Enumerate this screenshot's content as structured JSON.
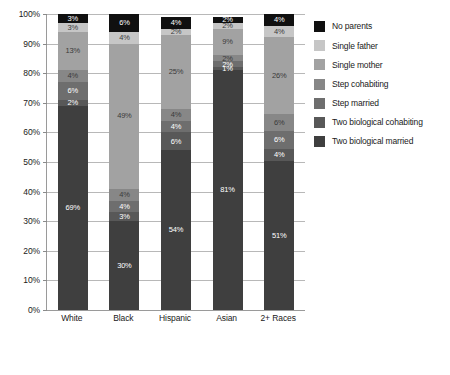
{
  "chart_data": {
    "type": "bar",
    "subtype": "stacked-100-percent",
    "title": "",
    "xlabel": "",
    "ylabel": "",
    "ylim": [
      0,
      100
    ],
    "ytick_labels": [
      "0%",
      "10%",
      "20%",
      "30%",
      "40%",
      "50%",
      "60%",
      "70%",
      "80%",
      "90%",
      "100%"
    ],
    "ytick_values": [
      0,
      10,
      20,
      30,
      40,
      50,
      60,
      70,
      80,
      90,
      100
    ],
    "grid": true,
    "legend_position": "right",
    "categories": [
      "White",
      "Black",
      "Hispanic",
      "Asian",
      "2+ Races"
    ],
    "series": [
      {
        "name": "Two biological married",
        "color": "#3f3f3f",
        "label_color": "#ffffff",
        "values": [
          69,
          30,
          54,
          81,
          51
        ]
      },
      {
        "name": "Two biological cohabiting",
        "color": "#585858",
        "label_color": "#ffffff",
        "values": [
          2,
          3,
          6,
          1,
          4
        ]
      },
      {
        "name": "Step married",
        "color": "#6e6e6e",
        "label_color": "#ffffff",
        "values": [
          6,
          4,
          4,
          2,
          6
        ]
      },
      {
        "name": "Step cohabiting",
        "color": "#878787",
        "label_color": "#3a3a3a",
        "values": [
          4,
          4,
          4,
          2,
          6
        ]
      },
      {
        "name": "Single mother",
        "color": "#a2a2a2",
        "label_color": "#3a3a3a",
        "values": [
          13,
          49,
          25,
          9,
          26
        ]
      },
      {
        "name": "Single father",
        "color": "#c6c6c6",
        "label_color": "#3a3a3a",
        "values": [
          3,
          4,
          2,
          2,
          4
        ]
      },
      {
        "name": "No parents",
        "color": "#101010",
        "label_color": "#ffffff",
        "values": [
          3,
          6,
          4,
          2,
          4
        ]
      }
    ],
    "legend_order": [
      "No parents",
      "Single father",
      "Single mother",
      "Step cohabiting",
      "Step married",
      "Two biological cohabiting",
      "Two biological married"
    ]
  }
}
